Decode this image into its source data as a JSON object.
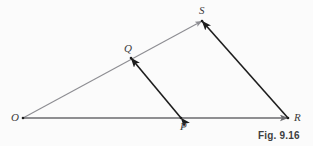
{
  "figure": {
    "caption": "Fig. 9.16",
    "caption_position": {
      "x": 258,
      "y": 130
    },
    "background_color": "#fbfbfb",
    "colors": {
      "light_ray": "#8d8d92",
      "base_ray": "#6a6a6e",
      "dark_segment": "#1d1d1d",
      "label_text": "#3a3a3a",
      "caption_text": "#3f3f3f"
    },
    "points": [
      {
        "name": "O",
        "label": "O",
        "x": 23,
        "y": 118,
        "label_x": 11,
        "label_y": 112
      },
      {
        "name": "P",
        "label": "P",
        "x": 181,
        "y": 118,
        "label_x": 180,
        "label_y": 121
      },
      {
        "name": "Q",
        "label": "Q",
        "x": 131,
        "y": 58,
        "label_x": 124,
        "label_y": 43
      },
      {
        "name": "R",
        "label": "R",
        "x": 288,
        "y": 118,
        "label_x": 294,
        "label_y": 112
      },
      {
        "name": "S",
        "label": "S",
        "x": 202,
        "y": 21,
        "label_x": 199,
        "label_y": 5
      }
    ],
    "segments": [
      {
        "name": "ray-O-to-S",
        "from": "O",
        "to": "S",
        "color": "#8d8d92",
        "width": 1.1,
        "arrow_start": false,
        "arrow_end": true,
        "passes_through": "Q"
      },
      {
        "name": "ray-O-to-R",
        "from": "O",
        "to": "R",
        "color": "#6a6a6e",
        "width": 1.3,
        "arrow_start": false,
        "arrow_end": true,
        "passes_through": "P"
      },
      {
        "name": "segment-P-to-Q",
        "from": "P",
        "to": "Q",
        "color": "#1d1d1d",
        "width": 1.6,
        "arrow_start": true,
        "arrow_end": true,
        "passes_through": ""
      },
      {
        "name": "segment-R-to-S",
        "from": "R",
        "to": "S",
        "color": "#1d1d1d",
        "width": 1.6,
        "arrow_start": false,
        "arrow_end": true,
        "passes_through": ""
      }
    ]
  }
}
